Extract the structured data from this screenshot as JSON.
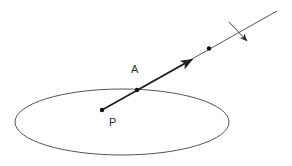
{
  "diagram": {
    "type": "geometry",
    "labels": {
      "point_a": "A",
      "point_p": "P"
    },
    "colors": {
      "stroke": "#333333",
      "thin_stroke": "#555555",
      "background": "#ffffff"
    },
    "ellipse": {
      "cx": 122,
      "cy": 122,
      "rx": 107,
      "ry": 33
    },
    "points": {
      "P": {
        "x": 102,
        "y": 110
      },
      "surface_point": {
        "x": 137,
        "y": 90
      },
      "outer_point": {
        "x": 209,
        "y": 48
      }
    },
    "vector": {
      "from": [
        102,
        110
      ],
      "to": [
        193,
        59
      ],
      "style": "bold-arrow"
    },
    "ray": {
      "from": [
        137,
        90
      ],
      "to": [
        277,
        11
      ],
      "style": "thin-line"
    },
    "crossing_arrow": {
      "from": [
        229,
        22
      ],
      "to": [
        248,
        42
      ],
      "style": "thin-arrow"
    }
  }
}
